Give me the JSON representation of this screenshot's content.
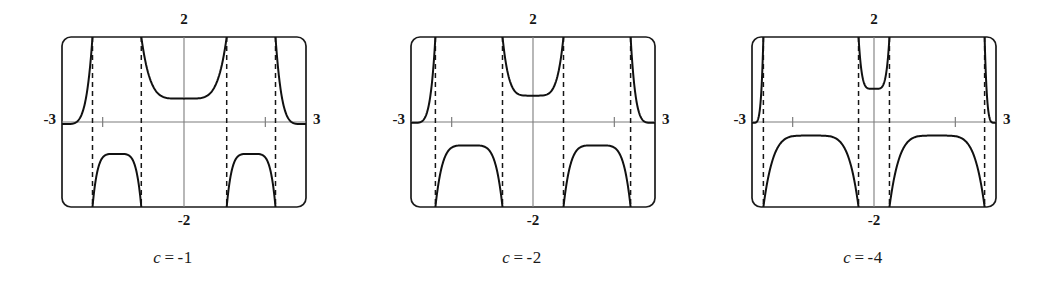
{
  "figure": {
    "background": "#ffffff",
    "panel_count": 3,
    "frame_color": "#1a1a1a",
    "axis_color": "#7d7d7d",
    "curve_color": "#111111",
    "asymptote_color": "#151515",
    "asymptote_style": "dashed"
  },
  "chart_data": {
    "type": "line",
    "title": "",
    "xlabel": "",
    "ylabel": "",
    "xlim": [
      -3,
      3
    ],
    "ylim": [
      -2,
      2
    ],
    "grid": false,
    "legend": "none",
    "shared_axis_labels": {
      "x_left": "-3",
      "x_right": "3",
      "y_top": "2",
      "y_bottom": "-2"
    },
    "x_ticks": [
      -2,
      2
    ],
    "y_ticks": [],
    "panels": [
      {
        "caption_variable": "c",
        "caption_equals": "=",
        "caption_value": "-1",
        "caption": "c = -1",
        "c": -1,
        "asymptotes": [
          -2.25,
          -1.05,
          1.05,
          2.25
        ],
        "frame_left_x": -3,
        "frame_right_x": 3,
        "branches": [
          {
            "name": "left-outer-falling",
            "x_from": -3.0,
            "x_to": -2.25,
            "y_from": -0.05,
            "y_to": 2.0,
            "shape": "rising-to-asymptote"
          },
          {
            "name": "left-lower-dome",
            "x_from": -2.25,
            "x_to": -1.05,
            "y_peak": -0.75,
            "shape": "inverted-u"
          },
          {
            "name": "center-u",
            "x_from": -1.05,
            "x_to": 1.05,
            "y_min": 0.55,
            "shape": "u"
          },
          {
            "name": "right-lower-dome",
            "x_from": 1.05,
            "x_to": 2.25,
            "y_peak": -0.75,
            "shape": "inverted-u"
          },
          {
            "name": "right-outer-falling",
            "x_from": 2.25,
            "x_to": 3.0,
            "y_from": 2.0,
            "y_to": -0.05,
            "shape": "falling-from-asymptote"
          }
        ]
      },
      {
        "caption_variable": "c",
        "caption_equals": "=",
        "caption_value": "-2",
        "caption": "c = -2",
        "c": -2,
        "asymptotes": [
          -2.4,
          -0.75,
          0.75,
          2.4
        ],
        "frame_left_x": -3,
        "frame_right_x": 3,
        "branches": [
          {
            "name": "left-outer-falling",
            "x_from": -3.0,
            "x_to": -2.4,
            "y_from": -0.02,
            "y_to": 2.0,
            "shape": "rising-to-asymptote"
          },
          {
            "name": "left-lower-dome",
            "x_from": -2.4,
            "x_to": -0.75,
            "y_peak": -0.55,
            "shape": "inverted-u"
          },
          {
            "name": "center-u",
            "x_from": -0.75,
            "x_to": 0.75,
            "y_min": 0.62,
            "shape": "u"
          },
          {
            "name": "right-lower-dome",
            "x_from": 0.75,
            "x_to": 2.4,
            "y_peak": -0.55,
            "shape": "inverted-u"
          },
          {
            "name": "right-outer-falling",
            "x_from": 2.4,
            "x_to": 3.0,
            "y_from": 2.0,
            "y_to": -0.02,
            "shape": "falling-from-asymptote"
          }
        ]
      },
      {
        "caption_variable": "c",
        "caption_equals": "=",
        "caption_value": "-4",
        "caption": "c = -4",
        "c": -4,
        "asymptotes": [
          -2.72,
          -0.38,
          0.38,
          2.72
        ],
        "frame_left_x": -3,
        "frame_right_x": 3,
        "branches": [
          {
            "name": "left-outer-falling",
            "x_from": -3.0,
            "x_to": -2.72,
            "y_from": -0.02,
            "y_to": 2.0,
            "shape": "rising-to-asymptote"
          },
          {
            "name": "left-lower-dome",
            "x_from": -2.72,
            "x_to": -0.38,
            "y_peak": -0.32,
            "shape": "inverted-u"
          },
          {
            "name": "center-u",
            "x_from": -0.38,
            "x_to": 0.38,
            "y_min": 0.78,
            "shape": "u"
          },
          {
            "name": "right-lower-dome",
            "x_from": 0.38,
            "x_to": 2.72,
            "y_peak": -0.32,
            "shape": "inverted-u"
          },
          {
            "name": "right-outer-falling",
            "x_from": 2.72,
            "x_to": 3.0,
            "y_from": 2.0,
            "y_to": -0.02,
            "shape": "falling-from-asymptote"
          }
        ]
      }
    ]
  }
}
